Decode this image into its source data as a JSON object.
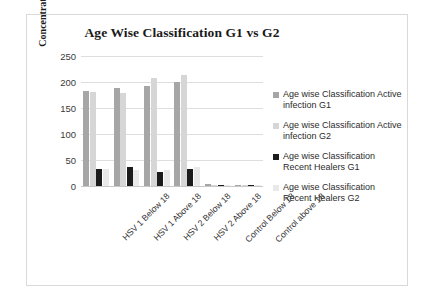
{
  "chart_data": {
    "type": "bar",
    "title": "Age Wise Classification G1 vs G2",
    "xlabel": "",
    "ylabel": "Concentration (pg/ml)",
    "ylim": [
      0,
      250
    ],
    "yticks": [
      0,
      50,
      100,
      150,
      200,
      250
    ],
    "grid": true,
    "legend_position": "right",
    "categories": [
      "HSV 1 Below 18",
      "HSV 1 Above 18",
      "HSV 2 Below 18",
      "HSV 2 Above 18",
      "Control Below 18",
      "Control above 18"
    ],
    "series": [
      {
        "name": "Age wise Classification Active infection G1",
        "color": "#a6a6a6",
        "values": [
          183,
          189,
          192,
          200,
          3,
          2
        ]
      },
      {
        "name": "Age wise Classification Active infection G2",
        "color": "#d6d6d6",
        "values": [
          180,
          179,
          208,
          213,
          2,
          2
        ]
      },
      {
        "name": "Age wise Classification Recent Healers G1",
        "color": "#1c1c1c",
        "values": [
          33,
          37,
          26,
          32,
          2,
          1
        ]
      },
      {
        "name": "Age wise Classification Recent Healers G2",
        "color": "#e9e9e9",
        "values": [
          33,
          31,
          31,
          36,
          2,
          1
        ]
      }
    ]
  },
  "legend": {
    "items": [
      {
        "label": "Age wise Classification Active infection G1",
        "color": "#a6a6a6"
      },
      {
        "label": "Age wise Classification Active infection G2",
        "color": "#d6d6d6"
      },
      {
        "label": "Age wise Classification Recent Healers G1",
        "color": "#1c1c1c"
      },
      {
        "label": "Age wise Classification Recent Healers G2",
        "color": "#e9e9e9"
      }
    ]
  }
}
